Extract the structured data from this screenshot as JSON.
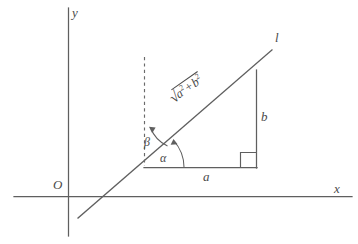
{
  "figure": {
    "type": "geometry-diagram",
    "background_color": "#ffffff",
    "stroke_color": "#5f5f5f",
    "text_color": "#4a4a4a"
  },
  "axes": {
    "y_label": "y",
    "x_label": "x",
    "origin_label": "O"
  },
  "line": {
    "label": "l"
  },
  "triangle": {
    "horizontal_leg_label": "a",
    "vertical_leg_label": "b",
    "hypotenuse": {
      "radical_sign": "√",
      "base_first": "a",
      "exponent_first": "2",
      "operator": "+",
      "base_second": "b",
      "exponent_second": "2",
      "plain_text": "√(a² + b²)"
    },
    "right_angle_marker": "square"
  },
  "angles": {
    "alpha_label": "α",
    "beta_label": "β"
  }
}
